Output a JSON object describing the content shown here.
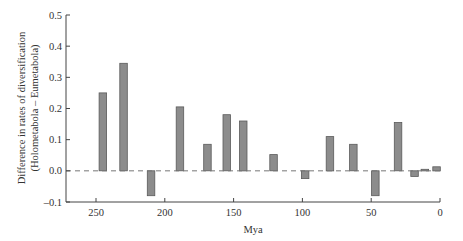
{
  "chart_data": {
    "type": "bar",
    "title": "",
    "xlabel": "Mya",
    "ylabel_line1": "Difference in rates of diversification",
    "ylabel_line2": "(Holometabola – Eumetabola)",
    "xlim": [
      272,
      0
    ],
    "ylim": [
      -0.1,
      0.5
    ],
    "x_ticks": [
      250,
      200,
      150,
      100,
      50,
      0
    ],
    "y_ticks": [
      -0.1,
      0.0,
      0.1,
      0.2,
      0.3,
      0.4,
      0.5
    ],
    "y_tick_labels": [
      "–0.1",
      "0.0",
      "0.1",
      "0.2",
      "0.3",
      "0.4",
      "0.5"
    ],
    "x_tick_labels": [
      "250",
      "200",
      "150",
      "100",
      "50",
      "0"
    ],
    "grid": false,
    "zero_line": "dashed",
    "bar_color": "#8c8c8c",
    "bar_edge_color": "#5a5a5a",
    "bars": [
      {
        "x": 245,
        "value": 0.25
      },
      {
        "x": 230,
        "value": 0.345
      },
      {
        "x": 210,
        "value": -0.08
      },
      {
        "x": 189,
        "value": 0.205
      },
      {
        "x": 169,
        "value": 0.085
      },
      {
        "x": 155,
        "value": 0.18
      },
      {
        "x": 143,
        "value": 0.16
      },
      {
        "x": 121,
        "value": 0.052
      },
      {
        "x": 98,
        "value": -0.025
      },
      {
        "x": 80,
        "value": 0.11
      },
      {
        "x": 63,
        "value": 0.085
      },
      {
        "x": 47,
        "value": -0.08
      },
      {
        "x": 30.5,
        "value": 0.155
      },
      {
        "x": 18.5,
        "value": -0.018
      },
      {
        "x": 11,
        "value": 0.005
      },
      {
        "x": 2.5,
        "value": 0.013
      }
    ]
  }
}
